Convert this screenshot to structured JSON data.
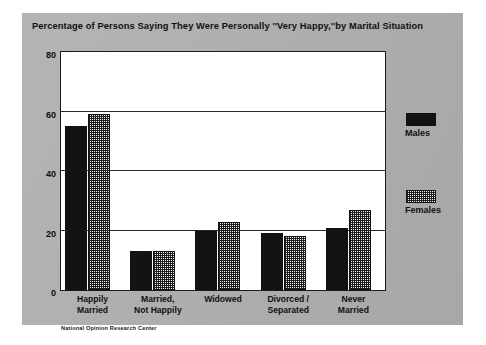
{
  "card": {
    "background_color": "#b0b0b0",
    "plot_background_color": "#ffffff"
  },
  "title": "Percentage of Persons Saying They Were Personally ''Very Happy,''by Marital Situation",
  "source_note": "National Opinion Research Center",
  "legend": {
    "entries": [
      {
        "label": "Males",
        "swatch": "solid-black-swatch",
        "color": "#131313"
      },
      {
        "label": "Females",
        "swatch": "hatched-swatch",
        "color": "#f2f2f2"
      }
    ]
  },
  "axis": {
    "y_ticks": [
      "0",
      "20",
      "40",
      "60",
      "80"
    ],
    "y_tick_values": [
      0,
      20,
      40,
      60,
      80
    ]
  },
  "chart_data": {
    "type": "bar",
    "title": "Percentage of Persons Saying They Were Personally ''Very Happy,''by Marital Situation",
    "xlabel": "",
    "ylabel": "",
    "ylim": [
      0,
      80
    ],
    "yticks": [
      0,
      20,
      40,
      60,
      80
    ],
    "grid": true,
    "legend_position": "right",
    "categories": [
      "Happily Married",
      "Married, Not Happily",
      "Widowed",
      "Divorced / Separated",
      "Never Married"
    ],
    "category_lines": [
      [
        "Happily",
        "Married"
      ],
      [
        "Married,",
        "Not Happily"
      ],
      [
        "Widowed",
        ""
      ],
      [
        "Divorced /",
        "Separated"
      ],
      [
        "Never",
        "Married"
      ]
    ],
    "series": [
      {
        "name": "Males",
        "values": [
          55,
          13,
          20,
          19,
          21
        ]
      },
      {
        "name": "Females",
        "values": [
          59,
          13,
          23,
          18,
          27
        ]
      }
    ],
    "source": "National Opinion Research Center"
  }
}
